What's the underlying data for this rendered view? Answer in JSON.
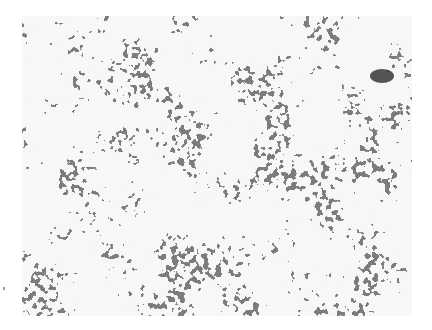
{
  "image": {
    "type": "histology-micrograph",
    "description": "Grayscale light micrograph of densely packed dark-staining tumor cells arranged in rosette-like and tubular clusters separated by pale stroma",
    "colors": {
      "background": "#ffffff",
      "stroma": "#e6e6e6",
      "nuclei": "#3a3a3a",
      "dark_cluster": "#1e1e1e"
    },
    "frame": {
      "left": 22,
      "top": 16,
      "width": 390,
      "height": 300
    }
  }
}
